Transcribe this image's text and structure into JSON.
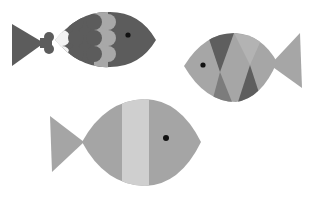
{
  "illustration": {
    "subject": "three stylized fish",
    "background_color": "#ffffff",
    "fish": [
      {
        "id": "fish-top-left",
        "style": "scalloped scales",
        "facing": "right",
        "colors": {
          "dark": "#5c5c5c",
          "light_band": "#a8a8a8",
          "white_scallop": "#f2f2f2",
          "eye": "#111111"
        }
      },
      {
        "id": "fish-right",
        "style": "triangle patches",
        "facing": "left",
        "colors": {
          "body": "#a6a6a6",
          "dark_triangle": "#5e5e5e",
          "mid_triangle": "#7c7c7c",
          "light_triangle": "#b3b3b3",
          "eye": "#111111"
        }
      },
      {
        "id": "fish-bottom",
        "style": "vertical stripe",
        "facing": "right",
        "colors": {
          "body": "#a5a5a5",
          "stripe": "#cfcfcf",
          "eye": "#111111"
        }
      }
    ]
  }
}
